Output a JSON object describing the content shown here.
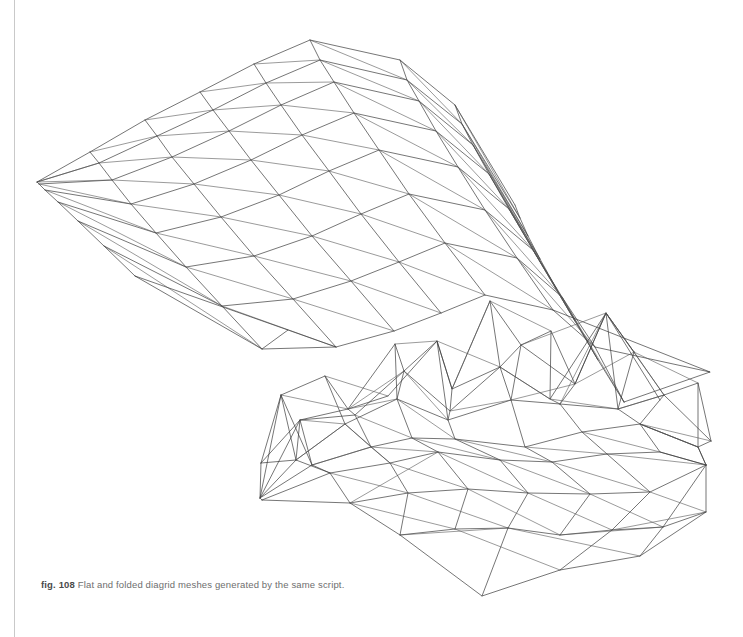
{
  "page": {
    "background_color": "#ffffff",
    "width": 743,
    "height": 637,
    "edge_line_color": "#c9c9c9"
  },
  "caption": {
    "label": "fig. 108",
    "text": "Flat and folded diagrid meshes generated by the same script.",
    "full": "fig. 108 Flat and folded diagrid meshes generated by the same script.",
    "color": "#6e6e6e"
  },
  "figure": {
    "stroke_color": "#3b3b3b",
    "stroke_width": 0.7,
    "figure_number": "108",
    "meshes": [
      {
        "name": "flat-diagrid-mesh",
        "description": "Smooth curved diagrid mesh surface converging to a point at the left",
        "cols": 8,
        "rows": 7,
        "grid": [
          [
            [
              37,
              182
            ],
            [
              90,
              152
            ],
            [
              145,
              120
            ],
            [
              200,
              92
            ],
            [
              254,
              64
            ],
            [
              310,
              40
            ],
            [
              400,
              60
            ],
            [
              455,
              105
            ],
            [
              515,
              205
            ]
          ],
          [
            [
              37,
              182
            ],
            [
              99,
              163
            ],
            [
              157,
              136
            ],
            [
              213,
              110
            ],
            [
              266,
              83
            ],
            [
              320,
              60
            ],
            [
              407,
              80
            ],
            [
              462,
              124
            ],
            [
              520,
              218
            ]
          ],
          [
            [
              39,
              184
            ],
            [
              112,
              180
            ],
            [
              172,
              157
            ],
            [
              229,
              131
            ],
            [
              281,
              105
            ],
            [
              334,
              82
            ],
            [
              419,
              101
            ],
            [
              473,
              145
            ],
            [
              528,
              236
            ]
          ],
          [
            [
              45,
              190
            ],
            [
              131,
              204
            ],
            [
              194,
              184
            ],
            [
              251,
              160
            ],
            [
              302,
              135
            ],
            [
              354,
              113
            ],
            [
              436,
              131
            ],
            [
              489,
              174
            ],
            [
              540,
              259
            ]
          ],
          [
            [
              58,
              202
            ],
            [
              156,
              233
            ],
            [
              221,
              217
            ],
            [
              279,
              195
            ],
            [
              329,
              171
            ],
            [
              379,
              150
            ],
            [
              458,
              167
            ],
            [
              509,
              209
            ],
            [
              556,
              288
            ]
          ],
          [
            [
              78,
              221
            ],
            [
              186,
              267
            ],
            [
              254,
              256
            ],
            [
              312,
              236
            ],
            [
              361,
              214
            ],
            [
              409,
              194
            ],
            [
              485,
              210
            ],
            [
              533,
              250
            ],
            [
              575,
              321
            ]
          ],
          [
            [
              104,
              246
            ],
            [
              222,
              306
            ],
            [
              293,
              299
            ],
            [
              351,
              281
            ],
            [
              399,
              262
            ],
            [
              445,
              243
            ],
            [
              517,
              258
            ],
            [
              562,
              297
            ],
            [
              598,
              360
            ]
          ],
          [
            [
              135,
              276
            ],
            [
              262,
              349
            ],
            [
              336,
              347
            ],
            [
              394,
              331
            ],
            [
              441,
              313
            ],
            [
              485,
              295
            ],
            [
              553,
              310
            ],
            [
              595,
              347
            ],
            [
              624,
              402
            ]
          ]
        ],
        "visible_rows": 7,
        "visible_cols": 8
      },
      {
        "name": "folded-diagrid-mesh",
        "description": "Faceted folded diagrid mesh with irregular peaks and valleys",
        "cols": 8,
        "rows": 6
      }
    ]
  }
}
